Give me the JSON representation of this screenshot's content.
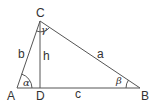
{
  "diagram": {
    "type": "right-triangle-altitude",
    "stroke_color": "#555555",
    "vertices": {
      "A": {
        "label": "A",
        "x": 17,
        "y": 88
      },
      "B": {
        "label": "B",
        "x": 140,
        "y": 88
      },
      "C": {
        "label": "C",
        "x": 40,
        "y": 21
      },
      "D": {
        "label": "D",
        "x": 40,
        "y": 88
      }
    },
    "sides": {
      "a": {
        "label": "a"
      },
      "b": {
        "label": "b"
      },
      "c": {
        "label": "c"
      },
      "h": {
        "label": "h"
      }
    },
    "angles": {
      "alpha": {
        "label": "α"
      },
      "beta": {
        "label": "β"
      },
      "gamma": {
        "label": "γ"
      }
    }
  }
}
